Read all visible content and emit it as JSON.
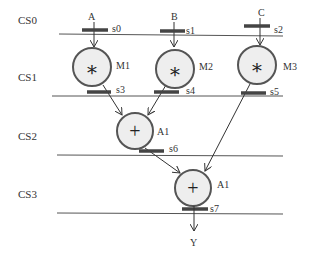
{
  "diagram": {
    "type": "scheduled data-flow graph",
    "control_steps": [
      {
        "id": "cs0",
        "label": "CS0",
        "y": 24
      },
      {
        "id": "cs1",
        "label": "CS1",
        "y": 80
      },
      {
        "id": "cs2",
        "label": "CS2",
        "y": 139
      },
      {
        "id": "cs3",
        "label": "CS3",
        "y": 197
      }
    ],
    "inputs": [
      {
        "id": "A",
        "label": "A"
      },
      {
        "id": "B",
        "label": "B"
      },
      {
        "id": "C",
        "label": "C"
      }
    ],
    "output": {
      "id": "Y",
      "label": "Y"
    },
    "nodes": [
      {
        "id": "M1",
        "label": "M1",
        "op": "*",
        "op_symbol": "∗"
      },
      {
        "id": "M2",
        "label": "M2",
        "op": "*",
        "op_symbol": "∗"
      },
      {
        "id": "M3",
        "label": "M3",
        "op": "*",
        "op_symbol": "∗"
      },
      {
        "id": "A1a",
        "label": "A1",
        "op": "+",
        "op_symbol": "+"
      },
      {
        "id": "A1b",
        "label": "A1",
        "op": "+",
        "op_symbol": "+"
      }
    ],
    "registers": [
      {
        "id": "s0",
        "label": "s0"
      },
      {
        "id": "s1",
        "label": "s1"
      },
      {
        "id": "s2",
        "label": "s2"
      },
      {
        "id": "s3",
        "label": "s3"
      },
      {
        "id": "s4",
        "label": "s4"
      },
      {
        "id": "s5",
        "label": "s5"
      },
      {
        "id": "s6",
        "label": "s6"
      },
      {
        "id": "s7",
        "label": "s7"
      }
    ],
    "edges": [
      [
        "A",
        "s0",
        "M1"
      ],
      [
        "B",
        "s1",
        "M2"
      ],
      [
        "C",
        "s2",
        "M3"
      ],
      [
        "M1",
        "s3",
        "A1a"
      ],
      [
        "M2",
        "s4",
        "A1a"
      ],
      [
        "M3",
        "s5",
        "A1b"
      ],
      [
        "A1a",
        "s6",
        "A1b"
      ],
      [
        "A1b",
        "s7",
        "Y"
      ]
    ],
    "colors": {
      "node_fill": "#eeeeee",
      "node_stroke": "#555555",
      "register_bar": "#444444",
      "text": "#333333"
    }
  }
}
